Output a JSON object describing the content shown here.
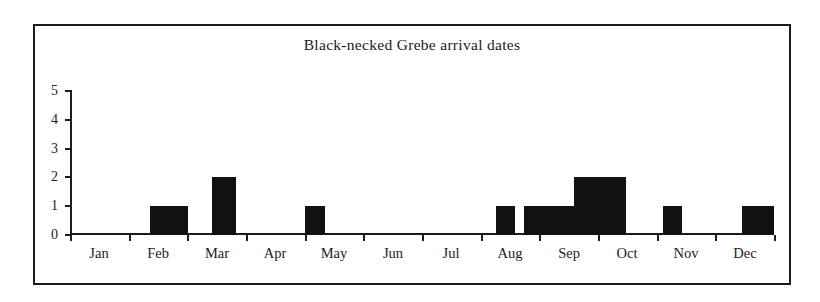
{
  "chart_data": {
    "type": "bar",
    "title": "Black-necked Grebe arrival dates",
    "xlabel": "",
    "ylabel": "",
    "categories": [
      "Jan",
      "Feb",
      "Mar",
      "Apr",
      "May",
      "Jun",
      "Jul",
      "Aug",
      "Sep",
      "Oct",
      "Nov",
      "Dec"
    ],
    "values": [
      0,
      1,
      2,
      0,
      1,
      0,
      0,
      1,
      2,
      1,
      0,
      1
    ],
    "ylim": [
      0,
      5
    ],
    "yticks": [
      "0",
      "1",
      "2",
      "3",
      "4",
      "5"
    ],
    "grid": false,
    "legend": null,
    "bar_color": "#111111",
    "axis_color": "#1c1c1c",
    "border_color": "#1c1c1c",
    "bars": [
      {
        "label": "Feb",
        "value": 1,
        "x": 80,
        "width": 38
      },
      {
        "label": "Mar",
        "value": 2,
        "x": 142,
        "width": 24
      },
      {
        "label": "May",
        "value": 1,
        "x": 235,
        "width": 20
      },
      {
        "label": "Aug",
        "value": 1,
        "x": 426,
        "width": 19
      },
      {
        "label": "Sep",
        "value": 1,
        "x": 454,
        "width": 50
      },
      {
        "label": "Sep",
        "value": 2,
        "x": 504,
        "width": 52
      },
      {
        "label": "Oct",
        "value": 1,
        "x": 593,
        "width": 19
      },
      {
        "label": "Dec",
        "value": 1,
        "x": 672,
        "width": 32
      }
    ]
  }
}
